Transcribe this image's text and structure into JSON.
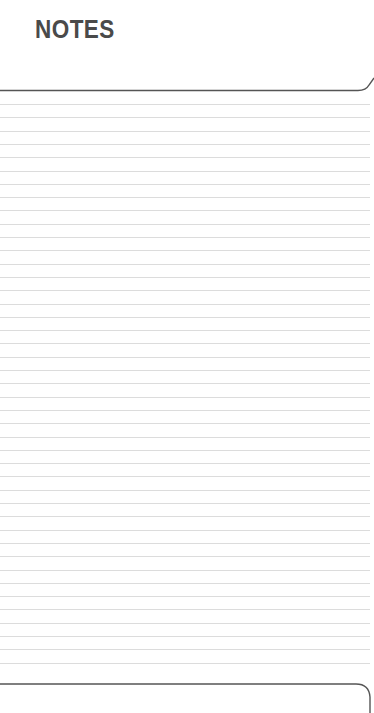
{
  "page": {
    "title": "NOTES",
    "ruled_lines": {
      "count": 43,
      "first_y": 104,
      "spacing": 13.3,
      "color": "#dcdcdc"
    },
    "border_color": "#555555"
  }
}
